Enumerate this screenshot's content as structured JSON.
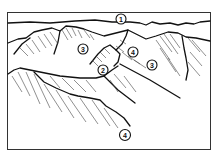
{
  "diagram": {
    "type": "terrain-sketch",
    "frame": {
      "x": 7,
      "y": 12,
      "width": 204,
      "height": 138
    },
    "labels": [
      {
        "id": "label-1",
        "text": "1",
        "x": 121,
        "y": 19
      },
      {
        "id": "label-3a",
        "text": "3",
        "x": 83,
        "y": 49
      },
      {
        "id": "label-4a",
        "text": "4",
        "x": 133,
        "y": 52
      },
      {
        "id": "label-3b",
        "text": "3",
        "x": 152,
        "y": 65
      },
      {
        "id": "label-2",
        "text": "2",
        "x": 103,
        "y": 70
      },
      {
        "id": "label-4b",
        "text": "4",
        "x": 125,
        "y": 135
      }
    ]
  }
}
